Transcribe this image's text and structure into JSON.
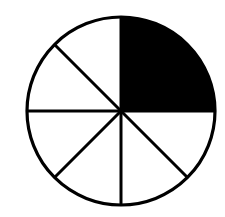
{
  "diagram": {
    "type": "fraction-circle",
    "total_sectors": 8,
    "shaded_sectors": 2,
    "shaded_fraction": "2/8",
    "shaded_position": "top-right quadrant",
    "colors": {
      "shaded": "#000000",
      "unshaded": "#ffffff",
      "outline": "#000000",
      "background": "#ffffff"
    },
    "geometry": {
      "cx": 121,
      "cy": 111,
      "r": 94,
      "stroke_width": 3.2
    }
  }
}
